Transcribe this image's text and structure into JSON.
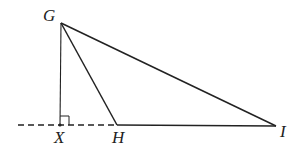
{
  "diagram": {
    "type": "geometry",
    "points": {
      "G": {
        "label": "G",
        "x": 61,
        "y": 23
      },
      "X": {
        "label": "X",
        "x": 60,
        "y": 125
      },
      "H": {
        "label": "H",
        "x": 117,
        "y": 125
      },
      "I": {
        "label": "I",
        "x": 276,
        "y": 126
      }
    },
    "segments": [
      {
        "from": "G",
        "to": "I",
        "style": "solid"
      },
      {
        "from": "G",
        "to": "H",
        "style": "solid"
      },
      {
        "from": "G",
        "to": "X",
        "style": "solid"
      },
      {
        "from": "H",
        "to": "I",
        "style": "solid"
      },
      {
        "from": "extension-left",
        "to": "H",
        "style": "dashed"
      }
    ],
    "right_angle_at": "X",
    "colors": {
      "stroke": "#222222",
      "background": "#ffffff"
    }
  }
}
